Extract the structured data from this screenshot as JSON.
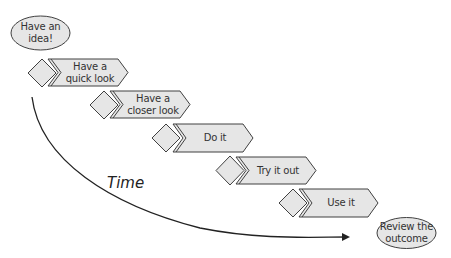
{
  "diagram": {
    "start": {
      "label": "Have an idea!"
    },
    "end": {
      "label": "Review the outcome"
    },
    "steps": [
      {
        "label": "Have a quick look"
      },
      {
        "label": "Have a closer look"
      },
      {
        "label": "Do it"
      },
      {
        "label": "Try it out"
      },
      {
        "label": "Use it"
      }
    ],
    "axis_label": "Time",
    "colors": {
      "fill": "#e6e6e6",
      "stroke": "#404040",
      "arrow": "#222222"
    }
  }
}
